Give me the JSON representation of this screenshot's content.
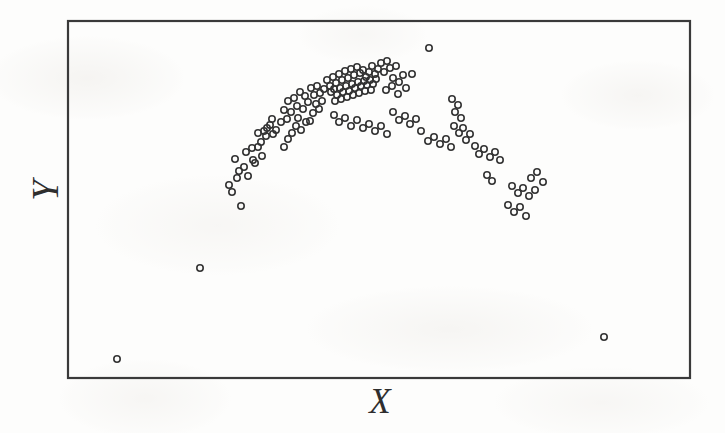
{
  "figure": {
    "width": 725,
    "height": 433,
    "background_color": "#fdfdfc",
    "frame_color": "#3a3a3a",
    "marker_color": "#333333",
    "label_color": "#2e2e2e"
  },
  "labels": {
    "x_axis": "X",
    "y_axis": "Y"
  },
  "chart_data": {
    "type": "scatter",
    "title": "",
    "subtitle": "",
    "xlabel": "X",
    "ylabel": "Y",
    "xlim": [
      0,
      100
    ],
    "ylim": [
      0,
      100
    ],
    "grid": false,
    "legend": null,
    "xtick_labels": [],
    "ytick_labels": [],
    "marker": {
      "shape": "open-circle",
      "diameter_px": 8,
      "stroke_width_px": 1.6,
      "fill": "none",
      "color": "#333333"
    },
    "plot_frame_px": {
      "left": 68,
      "top": 21,
      "right": 690,
      "bottom": 378
    },
    "n_points": 137,
    "points_px": [
      [
        117,
        359
      ],
      [
        200,
        268
      ],
      [
        604,
        337
      ],
      [
        429,
        48
      ],
      [
        412,
        74
      ],
      [
        229,
        185
      ],
      [
        235,
        159
      ],
      [
        239,
        171
      ],
      [
        241,
        206
      ],
      [
        246,
        152
      ],
      [
        248,
        176
      ],
      [
        252,
        148
      ],
      [
        255,
        163
      ],
      [
        258,
        133
      ],
      [
        261,
        142
      ],
      [
        264,
        131
      ],
      [
        267,
        128
      ],
      [
        266,
        136
      ],
      [
        270,
        125
      ],
      [
        273,
        134
      ],
      [
        272,
        119
      ],
      [
        276,
        130
      ],
      [
        258,
        147
      ],
      [
        262,
        156
      ],
      [
        253,
        160
      ],
      [
        244,
        167
      ],
      [
        237,
        178
      ],
      [
        232,
        192
      ],
      [
        281,
        122
      ],
      [
        284,
        110
      ],
      [
        287,
        119
      ],
      [
        288,
        101
      ],
      [
        291,
        112
      ],
      [
        294,
        98
      ],
      [
        297,
        106
      ],
      [
        300,
        92
      ],
      [
        298,
        118
      ],
      [
        303,
        109
      ],
      [
        305,
        96
      ],
      [
        308,
        102
      ],
      [
        296,
        126
      ],
      [
        292,
        133
      ],
      [
        288,
        139
      ],
      [
        284,
        147
      ],
      [
        301,
        130
      ],
      [
        306,
        122
      ],
      [
        311,
        88
      ],
      [
        314,
        95
      ],
      [
        317,
        86
      ],
      [
        320,
        93
      ],
      [
        316,
        104
      ],
      [
        313,
        113
      ],
      [
        310,
        121
      ],
      [
        319,
        109
      ],
      [
        322,
        101
      ],
      [
        324,
        89
      ],
      [
        327,
        80
      ],
      [
        330,
        86
      ],
      [
        333,
        77
      ],
      [
        336,
        83
      ],
      [
        339,
        74
      ],
      [
        342,
        80
      ],
      [
        345,
        71
      ],
      [
        348,
        78
      ],
      [
        351,
        69
      ],
      [
        354,
        75
      ],
      [
        357,
        67
      ],
      [
        360,
        73
      ],
      [
        363,
        70
      ],
      [
        366,
        77
      ],
      [
        369,
        72
      ],
      [
        372,
        66
      ],
      [
        375,
        74
      ],
      [
        378,
        69
      ],
      [
        331,
        92
      ],
      [
        334,
        89
      ],
      [
        337,
        95
      ],
      [
        340,
        88
      ],
      [
        343,
        92
      ],
      [
        346,
        86
      ],
      [
        349,
        91
      ],
      [
        352,
        84
      ],
      [
        355,
        88
      ],
      [
        358,
        82
      ],
      [
        361,
        86
      ],
      [
        364,
        81
      ],
      [
        367,
        85
      ],
      [
        370,
        80
      ],
      [
        373,
        84
      ],
      [
        376,
        79
      ],
      [
        335,
        101
      ],
      [
        341,
        99
      ],
      [
        347,
        97
      ],
      [
        353,
        95
      ],
      [
        359,
        93
      ],
      [
        365,
        91
      ],
      [
        371,
        90
      ],
      [
        381,
        63
      ],
      [
        384,
        72
      ],
      [
        387,
        61
      ],
      [
        390,
        68
      ],
      [
        393,
        78
      ],
      [
        396,
        66
      ],
      [
        399,
        82
      ],
      [
        386,
        90
      ],
      [
        392,
        86
      ],
      [
        398,
        94
      ],
      [
        403,
        75
      ],
      [
        406,
        88
      ],
      [
        334,
        115
      ],
      [
        339,
        122
      ],
      [
        345,
        118
      ],
      [
        351,
        126
      ],
      [
        357,
        120
      ],
      [
        363,
        128
      ],
      [
        369,
        124
      ],
      [
        375,
        131
      ],
      [
        381,
        126
      ],
      [
        387,
        134
      ],
      [
        393,
        112
      ],
      [
        399,
        120
      ],
      [
        405,
        116
      ],
      [
        410,
        124
      ],
      [
        416,
        119
      ],
      [
        421,
        131
      ],
      [
        452,
        99
      ],
      [
        455,
        112
      ],
      [
        458,
        105
      ],
      [
        461,
        118
      ],
      [
        454,
        126
      ],
      [
        459,
        133
      ],
      [
        463,
        128
      ],
      [
        466,
        140
      ],
      [
        470,
        134
      ],
      [
        428,
        141
      ],
      [
        434,
        137
      ],
      [
        440,
        144
      ],
      [
        446,
        139
      ],
      [
        451,
        147
      ],
      [
        475,
        146
      ],
      [
        479,
        154
      ],
      [
        484,
        149
      ],
      [
        490,
        157
      ],
      [
        495,
        152
      ],
      [
        500,
        160
      ],
      [
        487,
        175
      ],
      [
        492,
        181
      ],
      [
        512,
        186
      ],
      [
        518,
        193
      ],
      [
        523,
        188
      ],
      [
        529,
        196
      ],
      [
        535,
        190
      ],
      [
        508,
        205
      ],
      [
        514,
        212
      ],
      [
        520,
        207
      ],
      [
        526,
        216
      ],
      [
        531,
        178
      ],
      [
        537,
        172
      ],
      [
        543,
        182
      ]
    ]
  }
}
